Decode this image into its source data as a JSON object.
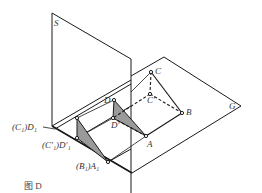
{
  "diagram": {
    "type": "descriptive-geometry-projection",
    "planes": [
      {
        "id": "S",
        "label": "S",
        "kind": "vertical projection plane"
      },
      {
        "id": "G",
        "label": "G",
        "kind": "ground plane"
      }
    ],
    "points": {
      "C": {
        "label": "C"
      },
      "C_prime": {
        "label": "C'"
      },
      "B": {
        "label": "B"
      },
      "A": {
        "label": "A"
      },
      "D": {
        "label": "D"
      },
      "D_prime": {
        "label": "D'"
      },
      "C1D1": {
        "label": "(C₁)D₁"
      },
      "C1pD1p": {
        "label": "(C'₁)D'₁"
      },
      "B1A1": {
        "label": "(B₁)A₁"
      }
    },
    "caption": "图 D",
    "colors": {
      "line": "#1a1a1a",
      "shade": "#9a9a9a",
      "background": "#ffffff"
    }
  }
}
